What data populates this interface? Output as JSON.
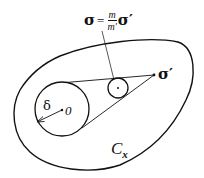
{
  "figure": {
    "formula": {
      "lhs": "σ",
      "equals": "=",
      "numerator": "m",
      "denominator": "m′",
      "rhs": "σ′"
    },
    "labels": {
      "point_sigma_prime": "σ′",
      "radius": "δ",
      "center": "0",
      "region": "C",
      "region_subscript": "x"
    },
    "colors": {
      "stroke": "#111111",
      "background": "#ffffff"
    }
  }
}
